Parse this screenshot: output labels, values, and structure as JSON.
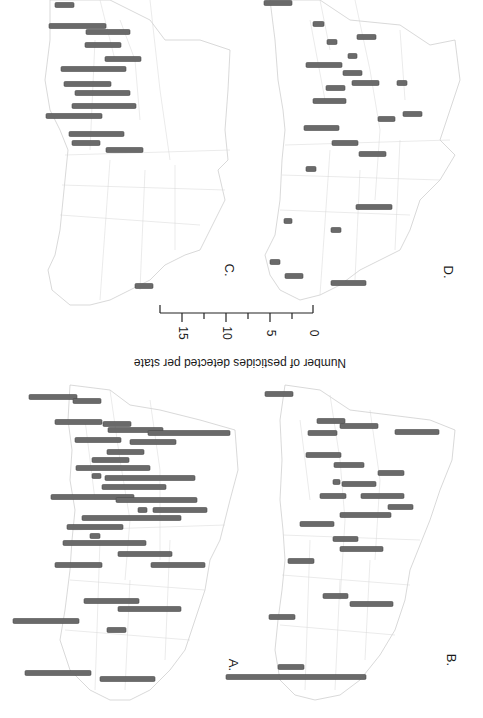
{
  "figure": {
    "orientation": "rotated 180deg (upside-down scan)",
    "bar_color": "#6a6a6a",
    "outline_color": "#c8c8c8"
  },
  "legend": {
    "title": "Number of pesticides detected per state",
    "ticks": [
      "15",
      "10",
      "5",
      "0"
    ]
  },
  "panels": {
    "A": {
      "label": "A."
    },
    "B": {
      "label": "B."
    },
    "C": {
      "label": "C."
    },
    "D": {
      "label": "D."
    }
  },
  "chart_data": {
    "type": "bar",
    "title": "",
    "subtitle": "Choropleth-style bar map of US states (four panels A-D), bar length proportional to pesticide count per state",
    "xlabel": "Number of pesticides detected per state",
    "ylabel": "",
    "scale_ticks": [
      0,
      5,
      10,
      15
    ],
    "xlim": [
      0,
      17.5
    ],
    "legend_position": "center",
    "grid": false,
    "series": [
      {
        "name": "A.",
        "values": [
          5.5,
          3.2,
          5.3,
          3.2,
          6.3,
          9.3,
          5.2,
          5.2,
          4.2,
          4.2,
          8.4,
          1.0,
          10.2,
          7.3,
          9.4,
          9.2,
          1.0,
          6.1,
          11.3,
          6.4,
          1.1,
          9.4,
          6.1,
          5.3,
          6.1,
          6.3,
          7.2,
          7.5,
          2.2,
          7.5,
          6.3
        ]
      },
      {
        "name": "B.",
        "values": [
          3.2,
          3.2,
          4.3,
          5.0,
          3.3,
          4.0,
          3.4,
          3.0,
          0.8,
          4.0,
          3.0,
          4.8,
          2.8,
          5.8,
          3.9,
          2.8,
          4.9,
          3.0,
          2.9,
          4.9,
          3.0,
          3.0,
          14.3
        ]
      },
      {
        "name": "C.",
        "values": [
          2.2,
          6.5,
          5.0,
          4.1,
          4.1,
          7.4,
          5.3,
          6.3,
          7.3,
          6.4,
          6.3,
          3.2,
          4.2,
          2.0
        ]
      },
      {
        "name": "D.",
        "values": [
          3.2,
          1.3,
          1.1,
          2.2,
          1.0,
          4.1,
          2.2,
          3.1,
          1.1,
          2.2,
          3.8,
          2.2,
          1.9,
          4.0,
          3.0,
          3.1,
          1.1,
          4.1,
          0.9,
          1.1,
          1.1,
          2.0,
          4.0
        ]
      }
    ]
  },
  "bars": {
    "A": [
      [
        29,
        77,
        397
      ],
      [
        73,
        101,
        401
      ],
      [
        55,
        102,
        422
      ],
      [
        103,
        131,
        424
      ],
      [
        108,
        163,
        430
      ],
      [
        148,
        230,
        433
      ],
      [
        75,
        121,
        440
      ],
      [
        130,
        176,
        442
      ],
      [
        107,
        144,
        452
      ],
      [
        92,
        129,
        460
      ],
      [
        76,
        150,
        468
      ],
      [
        92,
        101,
        476
      ],
      [
        105,
        195,
        478
      ],
      [
        102,
        166,
        487
      ],
      [
        51,
        134,
        497
      ],
      [
        116,
        197,
        500
      ],
      [
        138,
        147,
        510
      ],
      [
        153,
        207,
        510
      ],
      [
        82,
        181,
        518
      ],
      [
        67,
        123,
        527
      ],
      [
        90,
        100,
        536
      ],
      [
        63,
        146,
        543
      ],
      [
        118,
        172,
        554
      ],
      [
        55,
        102,
        565
      ],
      [
        151,
        205,
        565
      ],
      [
        84,
        139,
        601
      ],
      [
        118,
        181,
        609
      ],
      [
        13,
        79,
        621
      ],
      [
        107,
        126,
        630
      ],
      [
        25,
        91,
        673
      ],
      [
        100,
        155,
        679
      ]
    ],
    "B": [
      [
        265,
        293,
        394
      ],
      [
        317,
        345,
        421
      ],
      [
        340,
        378,
        426
      ],
      [
        395,
        439,
        432
      ],
      [
        308,
        337,
        433
      ],
      [
        306,
        341,
        455
      ],
      [
        334,
        364,
        465
      ],
      [
        378,
        404,
        473
      ],
      [
        333,
        340,
        482
      ],
      [
        342,
        376,
        484
      ],
      [
        320,
        346,
        496
      ],
      [
        361,
        404,
        496
      ],
      [
        388,
        413,
        507
      ],
      [
        340,
        391,
        515
      ],
      [
        300,
        334,
        524
      ],
      [
        333,
        358,
        539
      ],
      [
        340,
        383,
        549
      ],
      [
        288,
        314,
        561
      ],
      [
        323,
        348,
        596
      ],
      [
        350,
        393,
        604
      ],
      [
        269,
        295,
        617
      ],
      [
        278,
        304,
        667
      ],
      [
        226,
        366,
        677
      ]
    ],
    "C": [
      [
        55,
        74,
        5
      ],
      [
        49,
        106,
        26
      ],
      [
        86,
        130,
        32
      ],
      [
        85,
        121,
        45
      ],
      [
        105,
        141,
        59
      ],
      [
        61,
        126,
        69
      ],
      [
        64,
        111,
        84
      ],
      [
        75,
        130,
        93
      ],
      [
        72,
        136,
        106
      ],
      [
        46,
        102,
        116
      ],
      [
        69,
        124,
        134
      ],
      [
        72,
        100,
        143
      ],
      [
        106,
        143,
        150
      ],
      [
        135,
        153,
        286
      ]
    ],
    "D": [
      [
        264,
        292,
        3
      ],
      [
        313,
        324,
        24
      ],
      [
        327,
        337,
        42
      ],
      [
        357,
        376,
        37
      ],
      [
        348,
        357,
        56
      ],
      [
        306,
        342,
        65
      ],
      [
        343,
        362,
        73
      ],
      [
        352,
        379,
        83
      ],
      [
        397,
        407,
        83
      ],
      [
        326,
        345,
        88
      ],
      [
        313,
        346,
        101
      ],
      [
        403,
        422,
        114
      ],
      [
        378,
        395,
        119
      ],
      [
        304,
        339,
        128
      ],
      [
        332,
        358,
        143
      ],
      [
        359,
        386,
        154
      ],
      [
        306,
        316,
        169
      ],
      [
        356,
        392,
        207
      ],
      [
        284,
        292,
        221
      ],
      [
        331,
        341,
        230
      ],
      [
        270,
        280,
        262
      ],
      [
        285,
        303,
        276
      ],
      [
        331,
        366,
        283
      ]
    ]
  }
}
